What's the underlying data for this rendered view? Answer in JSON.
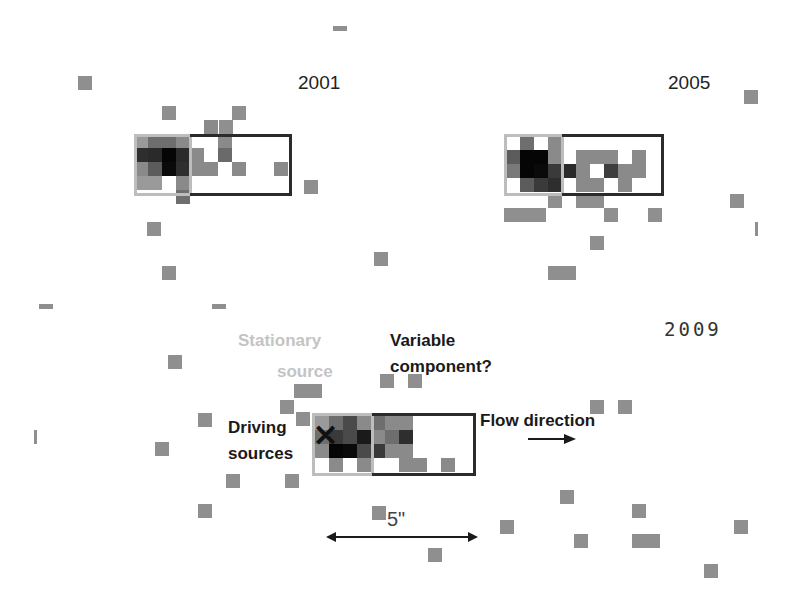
{
  "figure": {
    "panels": [
      {
        "year": "2001",
        "year_pos": [
          298,
          72
        ],
        "stationary_box": [
          134,
          134,
          58,
          62
        ],
        "variable_box": [
          190,
          134,
          102,
          62
        ],
        "origin": [
          134,
          134
        ],
        "cells": [
          [
            0,
            0,
            "#9a9a9a"
          ],
          [
            1,
            0,
            "#6e6e6e"
          ],
          [
            2,
            0,
            "#6e6e6e"
          ],
          [
            3,
            0,
            "#8a8a8a"
          ],
          [
            0,
            1,
            "#2e2e2e"
          ],
          [
            1,
            1,
            "#2a2a2a"
          ],
          [
            2,
            1,
            "#050505"
          ],
          [
            3,
            1,
            "#2a2a2a"
          ],
          [
            4,
            1,
            "#8a8a8a"
          ],
          [
            6,
            1,
            "#6a6a6a"
          ],
          [
            0,
            2,
            "#8a8a8a"
          ],
          [
            1,
            2,
            "#5c5c5c"
          ],
          [
            2,
            2,
            "#0a0a0a"
          ],
          [
            3,
            2,
            "#2e2e2e"
          ],
          [
            4,
            2,
            "#8a8a8a"
          ],
          [
            5,
            2,
            "#8a8a8a"
          ],
          [
            7,
            2,
            "#8a8a8a"
          ],
          [
            10,
            2,
            "#8a8a8a"
          ],
          [
            0,
            3,
            "#9a9a9a"
          ],
          [
            1,
            3,
            "#9a9a9a"
          ],
          [
            3,
            3,
            "#8a8a8a"
          ],
          [
            6,
            0,
            "#8a8a8a"
          ],
          [
            3,
            4,
            "#6e6e6e"
          ],
          [
            5,
            -1,
            "#8a8a8a"
          ]
        ]
      },
      {
        "year": "2005",
        "year_pos": [
          668,
          72
        ],
        "stationary_box": [
          504,
          134,
          60,
          62
        ],
        "variable_box": [
          562,
          134,
          102,
          62
        ],
        "origin": [
          506,
          136
        ],
        "cells": [
          [
            1,
            0,
            "#6e6e6e"
          ],
          [
            3,
            0,
            "#8a8a8a"
          ],
          [
            0,
            1,
            "#5c5c5c"
          ],
          [
            1,
            1,
            "#050505"
          ],
          [
            2,
            1,
            "#050505"
          ],
          [
            3,
            1,
            "#8a8a8a"
          ],
          [
            5,
            1,
            "#8a8a8a"
          ],
          [
            6,
            1,
            "#8a8a8a"
          ],
          [
            7,
            1,
            "#8a8a8a"
          ],
          [
            9,
            1,
            "#8a8a8a"
          ],
          [
            0,
            2,
            "#7a7a7a"
          ],
          [
            1,
            2,
            "#050505"
          ],
          [
            2,
            2,
            "#0a0a0a"
          ],
          [
            3,
            2,
            "#3a3a3a"
          ],
          [
            4,
            2,
            "#2a2a2a"
          ],
          [
            5,
            2,
            "#8a8a8a"
          ],
          [
            7,
            2,
            "#3e3e3e"
          ],
          [
            8,
            2,
            "#8a8a8a"
          ],
          [
            9,
            2,
            "#8a8a8a"
          ],
          [
            1,
            3,
            "#5c5c5c"
          ],
          [
            2,
            3,
            "#3a3a3a"
          ],
          [
            3,
            3,
            "#2e2e2e"
          ],
          [
            5,
            3,
            "#8a8a8a"
          ],
          [
            6,
            3,
            "#8a8a8a"
          ],
          [
            8,
            3,
            "#8a8a8a"
          ]
        ]
      },
      {
        "year": "2009",
        "year_pos": [
          664,
          318
        ],
        "stationary_box": [
          312,
          413,
          62,
          63
        ],
        "variable_box": [
          372,
          413,
          104,
          63
        ],
        "origin": [
          315,
          416
        ],
        "cells": [
          [
            0,
            0,
            "#9a9a9a"
          ],
          [
            1,
            0,
            "#6e6e6e"
          ],
          [
            2,
            0,
            "#4a4a4a"
          ],
          [
            3,
            0,
            "#8a8a8a"
          ],
          [
            4,
            0,
            "#6e6e6e"
          ],
          [
            5,
            0,
            "#8a8a8a"
          ],
          [
            6,
            0,
            "#8a8a8a"
          ],
          [
            0,
            1,
            "#6e6e6e"
          ],
          [
            1,
            1,
            "#3a3a3a"
          ],
          [
            2,
            1,
            "#4a4a4a"
          ],
          [
            3,
            1,
            "#1a1a1a"
          ],
          [
            4,
            1,
            "#8a8a8a"
          ],
          [
            5,
            1,
            "#6e6e6e"
          ],
          [
            6,
            1,
            "#2e2e2e"
          ],
          [
            0,
            2,
            "#8a8a8a"
          ],
          [
            1,
            2,
            "#050505"
          ],
          [
            2,
            2,
            "#0a0a0a"
          ],
          [
            3,
            2,
            "#4a4a4a"
          ],
          [
            4,
            2,
            "#3a3a3a"
          ],
          [
            5,
            2,
            "#8a8a8a"
          ],
          [
            6,
            2,
            "#8a8a8a"
          ],
          [
            1,
            3,
            "#8a8a8a"
          ],
          [
            3,
            3,
            "#8a8a8a"
          ],
          [
            6,
            3,
            "#8a8a8a"
          ],
          [
            7,
            3,
            "#8a8a8a"
          ],
          [
            9,
            3,
            "#8a8a8a"
          ]
        ]
      }
    ],
    "noise": [
      [
        333,
        26,
        14,
        5
      ],
      [
        78,
        76,
        14,
        14
      ],
      [
        162,
        106,
        14,
        14
      ],
      [
        232,
        106,
        14,
        14
      ],
      [
        219,
        120,
        14,
        14
      ],
      [
        304,
        180,
        14,
        14
      ],
      [
        147,
        222,
        14,
        14
      ],
      [
        162,
        266,
        14,
        14
      ],
      [
        374,
        252,
        14,
        14
      ],
      [
        39,
        304,
        14,
        5
      ],
      [
        212,
        304,
        14,
        5
      ],
      [
        168,
        355,
        14,
        14
      ],
      [
        744,
        90,
        14,
        14
      ],
      [
        504,
        208,
        14,
        14
      ],
      [
        518,
        208,
        28,
        14
      ],
      [
        548,
        194,
        14,
        14
      ],
      [
        576,
        194,
        28,
        14
      ],
      [
        604,
        208,
        14,
        14
      ],
      [
        648,
        208,
        14,
        14
      ],
      [
        730,
        194,
        14,
        14
      ],
      [
        755,
        222,
        3,
        14
      ],
      [
        590,
        236,
        14,
        14
      ],
      [
        548,
        266,
        28,
        14
      ],
      [
        294,
        384,
        28,
        14
      ],
      [
        280,
        400,
        14,
        14
      ],
      [
        296,
        412,
        14,
        14
      ],
      [
        380,
        374,
        14,
        14
      ],
      [
        408,
        374,
        14,
        14
      ],
      [
        590,
        400,
        14,
        14
      ],
      [
        618,
        400,
        14,
        14
      ],
      [
        198,
        413,
        14,
        14
      ],
      [
        155,
        442,
        14,
        14
      ],
      [
        34,
        430,
        3,
        14
      ],
      [
        226,
        474,
        14,
        14
      ],
      [
        285,
        474,
        14,
        14
      ],
      [
        198,
        504,
        14,
        14
      ],
      [
        372,
        506,
        14,
        14
      ],
      [
        428,
        548,
        14,
        14
      ],
      [
        500,
        520,
        14,
        14
      ],
      [
        560,
        490,
        14,
        14
      ],
      [
        574,
        534,
        14,
        14
      ],
      [
        632,
        504,
        14,
        14
      ],
      [
        632,
        534,
        28,
        14
      ],
      [
        734,
        520,
        14,
        14
      ],
      [
        704,
        564,
        14,
        14
      ]
    ]
  },
  "labels": {
    "stationary_line1": "Stationary",
    "stationary_line2": "source",
    "variable_line1": "Variable",
    "variable_line2": "component?",
    "driving_line1": "Driving",
    "driving_line2": "sources",
    "flow": "Flow direction",
    "cross": "✕",
    "scale": "5\""
  },
  "colors": {
    "stationary_box": "#bdbdbd",
    "variable_box": "#2b2b2b",
    "noise": "#8f8f8f",
    "stationary_text": "#c4c4c4",
    "dark_text": "#1a1a1a"
  }
}
